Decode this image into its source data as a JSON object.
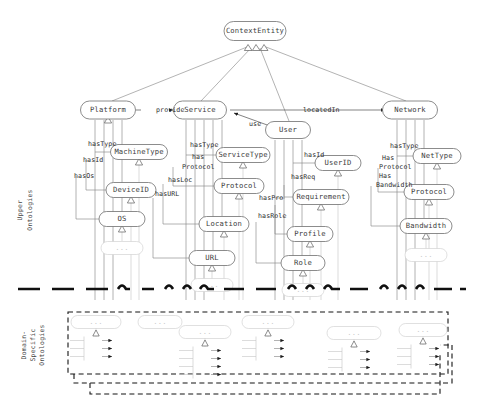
{
  "figure": {
    "root": "ContextEntity",
    "layers": [
      {
        "id": "upper",
        "label": "Upper\nOntologies",
        "label_line1": "Upper",
        "label_line2": "Ontologies"
      },
      {
        "id": "domain",
        "label": "Domain-Specific Ontologies",
        "label_line1": "Domain-",
        "label_line2": "Specific",
        "label_line3": "Ontologies"
      }
    ]
  },
  "nodes": {
    "root": {
      "label": "ContextEntity",
      "x": 255,
      "y": 31,
      "w": 62,
      "h": 19
    },
    "level1": [
      {
        "id": "platform",
        "label": "Platform",
        "x": 108,
        "y": 110,
        "w": 55,
        "h": 18
      },
      {
        "id": "service",
        "label": "Service",
        "x": 200,
        "y": 110,
        "w": 53,
        "h": 18
      },
      {
        "id": "user",
        "label": "User",
        "x": 288,
        "y": 130,
        "w": 45,
        "h": 17
      },
      {
        "id": "network",
        "label": "Network",
        "x": 410,
        "y": 110,
        "w": 55,
        "h": 18
      }
    ],
    "level2": [
      {
        "id": "machinetype",
        "label": "MachineType",
        "x": 139,
        "y": 152,
        "w": 57,
        "h": 15,
        "parent": "platform"
      },
      {
        "id": "deviceid",
        "label": "DeviceID",
        "x": 131,
        "y": 190,
        "w": 50,
        "h": 15,
        "parent": "platform"
      },
      {
        "id": "os",
        "label": "OS",
        "x": 122,
        "y": 219,
        "w": 46,
        "h": 15,
        "parent": "platform"
      },
      {
        "id": "servicetype",
        "label": "ServiceType",
        "x": 243,
        "y": 155,
        "w": 54,
        "h": 15,
        "parent": "service"
      },
      {
        "id": "protocol_s",
        "label": "Protocol",
        "x": 239,
        "y": 186,
        "w": 50,
        "h": 15,
        "parent": "service"
      },
      {
        "id": "location",
        "label": "Location",
        "x": 224,
        "y": 224,
        "w": 50,
        "h": 15,
        "parent": "service"
      },
      {
        "id": "url",
        "label": "URL",
        "x": 212,
        "y": 258,
        "w": 46,
        "h": 15,
        "parent": "service"
      },
      {
        "id": "userid",
        "label": "UserID",
        "x": 338,
        "y": 163,
        "w": 46,
        "h": 15,
        "parent": "user"
      },
      {
        "id": "requirement",
        "label": "Requirement",
        "x": 321,
        "y": 197,
        "w": 56,
        "h": 15,
        "parent": "user"
      },
      {
        "id": "profile",
        "label": "Profile",
        "x": 310,
        "y": 234,
        "w": 46,
        "h": 15,
        "parent": "user"
      },
      {
        "id": "role",
        "label": "Role",
        "x": 303,
        "y": 263,
        "w": 44,
        "h": 15,
        "parent": "user"
      },
      {
        "id": "nettype",
        "label": "NetType",
        "x": 437,
        "y": 156,
        "w": 48,
        "h": 15,
        "parent": "network"
      },
      {
        "id": "protocol_n",
        "label": "Protocol",
        "x": 429,
        "y": 192,
        "w": 50,
        "h": 15,
        "parent": "network"
      },
      {
        "id": "bandwidth",
        "label": "Bandwidth",
        "x": 426,
        "y": 226,
        "w": 52,
        "h": 15,
        "parent": "network"
      }
    ],
    "ellipsis": [
      {
        "id": "ell-os",
        "label": "...",
        "x": 122,
        "y": 248,
        "w": 42,
        "h": 13
      },
      {
        "id": "ell-url",
        "label": "...",
        "x": 212,
        "y": 285,
        "w": 42,
        "h": 13
      },
      {
        "id": "ell-role",
        "label": "...",
        "x": 303,
        "y": 290,
        "w": 42,
        "h": 13
      },
      {
        "id": "ell-bandwidth",
        "label": "...",
        "x": 426,
        "y": 255,
        "w": 42,
        "h": 13
      }
    ]
  },
  "edges": {
    "subclass_to_root": [
      {
        "from": "platform",
        "to": "root"
      },
      {
        "from": "service",
        "to": "root"
      },
      {
        "from": "user",
        "to": "root"
      },
      {
        "from": "network",
        "to": "root"
      }
    ],
    "object_properties": [
      {
        "label": "provide",
        "from": "platform",
        "to": "service",
        "x": 156,
        "y": 110
      },
      {
        "label": "locatedIn",
        "from": "service",
        "to": "network",
        "x": 303,
        "y": 110
      },
      {
        "label": "use",
        "from": "user",
        "to": "service",
        "x": 249,
        "y": 124
      }
    ],
    "datatype_properties": [
      {
        "label": "hasType",
        "parent": "platform",
        "to": "machinetype",
        "x": 88,
        "y": 144
      },
      {
        "label": "hasId",
        "parent": "platform",
        "to": "deviceid",
        "x": 83,
        "y": 160
      },
      {
        "label": "hasOs",
        "parent": "platform",
        "to": "os",
        "x": 74,
        "y": 176
      },
      {
        "label": "hasType",
        "parent": "service",
        "to": "servicetype",
        "x": 190,
        "y": 145
      },
      {
        "label": "has",
        "parent": "service",
        "to": "protocol_s",
        "x": 192,
        "y": 157
      },
      {
        "label": "Protocol",
        "parent": "service",
        "to": "protocol_s",
        "x": 182,
        "y": 167
      },
      {
        "label": "hasLoc",
        "parent": "service",
        "to": "location",
        "x": 168,
        "y": 180
      },
      {
        "label": "hasURL",
        "parent": "service",
        "to": "url",
        "x": 155,
        "y": 194
      },
      {
        "label": "hasId",
        "parent": "user",
        "to": "userid",
        "x": 304,
        "y": 155
      },
      {
        "label": "hasReq",
        "parent": "user",
        "to": "requirement",
        "x": 291,
        "y": 177
      },
      {
        "label": "hasPro",
        "parent": "user",
        "to": "profile",
        "x": 259,
        "y": 198
      },
      {
        "label": "hasRole",
        "parent": "user",
        "to": "role",
        "x": 258,
        "y": 216
      },
      {
        "label": "hasType",
        "parent": "network",
        "to": "nettype",
        "x": 390,
        "y": 146
      },
      {
        "label": "Has",
        "parent": "network",
        "to": "protocol_n",
        "x": 382,
        "y": 158
      },
      {
        "label": "Protocol",
        "parent": "network",
        "to": "protocol_n",
        "x": 379,
        "y": 167
      },
      {
        "label": "Has",
        "parent": "network",
        "to": "bandwidth",
        "x": 379,
        "y": 176
      },
      {
        "label": "Bandwidth",
        "parent": "network",
        "to": "bandwidth",
        "x": 376,
        "y": 185
      }
    ]
  },
  "domain_section": {
    "label_lines": [
      "Domain-",
      "Specific",
      "Ontologies"
    ],
    "outer_box": {
      "x": 68,
      "y": 312,
      "w": 380,
      "h": 62
    },
    "groups": [
      {
        "id": "g1",
        "label": "...",
        "x": 96,
        "y": 322,
        "w": 50,
        "h": 13,
        "branches": 3
      },
      {
        "id": "g2",
        "label": "...",
        "x": 160,
        "y": 322,
        "w": 44,
        "h": 13,
        "branches": 0
      },
      {
        "id": "g3",
        "label": "...",
        "x": 205,
        "y": 332,
        "w": 52,
        "h": 13,
        "branches": 4
      },
      {
        "id": "g4",
        "label": "...",
        "x": 268,
        "y": 322,
        "w": 52,
        "h": 13,
        "branches": 3
      },
      {
        "id": "g5",
        "label": "...",
        "x": 354,
        "y": 333,
        "w": 54,
        "h": 13,
        "branches": 3
      },
      {
        "id": "g6",
        "label": "...",
        "x": 423,
        "y": 330,
        "w": 48,
        "h": 13,
        "branches": 3
      }
    ]
  },
  "style": {
    "node_stroke": "#6e6e6e",
    "node_fill": "#ffffff",
    "link_stroke": "#8a8a8a",
    "faded_stroke": "#d2d2d2",
    "text_color": "#3b3b3b",
    "separator_color": "#101010",
    "dashed_box_color": "#151515",
    "background": "#ffffff"
  }
}
